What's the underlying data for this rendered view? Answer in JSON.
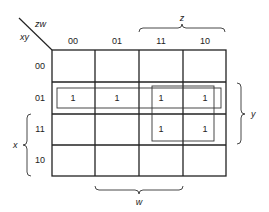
{
  "kmap": {
    "corner": {
      "col_vars": "zw",
      "row_vars": "xy"
    },
    "col_labels": [
      "00",
      "01",
      "11",
      "10"
    ],
    "row_labels": [
      "00",
      "01",
      "11",
      "10"
    ],
    "cells": [
      [
        "",
        "",
        "",
        ""
      ],
      [
        "1",
        "1",
        "1",
        "1"
      ],
      [
        "",
        "",
        "1",
        "1"
      ],
      [
        "",
        "",
        "",
        ""
      ]
    ],
    "brace_labels": {
      "top": "z",
      "right": "y",
      "left": "x",
      "bottom": "w"
    },
    "groups": [
      {
        "name": "row-01-group",
        "rows": [
          1
        ],
        "cols": [
          0,
          1,
          2,
          3
        ]
      },
      {
        "name": "square-group",
        "rows": [
          1,
          2
        ],
        "cols": [
          2,
          3
        ]
      }
    ]
  }
}
